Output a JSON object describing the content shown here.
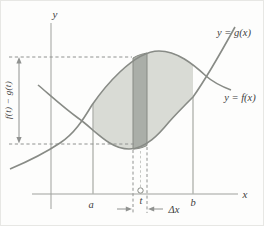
{
  "figure": {
    "axis": {
      "x_label": "x",
      "y_label": "y"
    },
    "curves": [
      {
        "id": "g",
        "label": "y = g(x)"
      },
      {
        "id": "f",
        "label": "y = f(x)"
      }
    ],
    "region": {
      "left_bound_label": "a",
      "right_bound_label": "b",
      "sample_point_label": "t",
      "strip_width_label": "Δx",
      "strip_height_label": "f(t) − g(t)"
    },
    "colors": {
      "region_fill": "#d9dbd5",
      "strip_fill": "#aaaea8",
      "strip_edge": "#878a84",
      "curve": "#888b86",
      "axis": "#9fa19d",
      "bound_line": "#b3b5b1",
      "dashed": "#909290",
      "dashed_light": "#c7c9c5",
      "text": "#3e3e3e"
    }
  }
}
